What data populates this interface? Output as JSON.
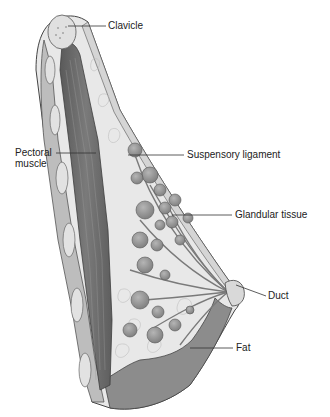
{
  "diagram": {
    "type": "anatomical-cross-section",
    "labels": [
      {
        "id": "clavicle",
        "text": "Clavicle",
        "x": 108,
        "y": 21
      },
      {
        "id": "pectoral-muscle",
        "text": "Pectoral\nmuscle",
        "x": 15,
        "y": 148
      },
      {
        "id": "suspensory-ligament",
        "text": "Suspensory ligament",
        "x": 187,
        "y": 150
      },
      {
        "id": "glandular-tissue",
        "text": "Glandular tissue",
        "x": 235,
        "y": 210
      },
      {
        "id": "duct",
        "text": "Duct",
        "x": 268,
        "y": 291
      },
      {
        "id": "fat",
        "text": "Fat",
        "x": 236,
        "y": 343
      }
    ],
    "colors": {
      "background": "#ffffff",
      "muscle": "#6e6e6e",
      "skin_fat_layer": "#8a8a8a",
      "fatty_tissue": "#e6e6e6",
      "lobules": "#9a9a9a",
      "outline": "#444444",
      "leader_line": "#333333"
    }
  }
}
